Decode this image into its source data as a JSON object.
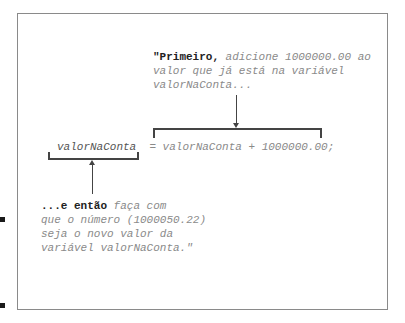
{
  "diagram": {
    "top_note": {
      "bold": "\"Primeiro,",
      "line1_rest": " adicione 1000000.00 ao",
      "line2": "valor que já está na variável",
      "line3": "valorNaConta..."
    },
    "code_line": {
      "lhs": "valorNaConta",
      "rhs": "= valorNaConta + 1000000.00;"
    },
    "bottom_note": {
      "bold": "...e então",
      "line1_rest": " faça com",
      "line2": "que o número (1000050.22)",
      "line3": "seja o novo valor da",
      "line4": "variável valorNaConta.\""
    },
    "colors": {
      "text": "#8a8a8a",
      "bold_text": "#222222",
      "lines": "#444444",
      "frame": "#8a8a8a"
    }
  }
}
